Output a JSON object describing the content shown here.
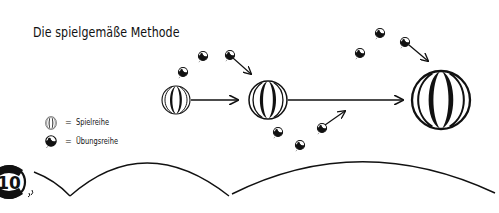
{
  "title": "Die spielgemäße Methode",
  "legend": {
    "items": [
      {
        "icon": "large-striped-ball-icon",
        "equals": "=",
        "label": "Spielreihe"
      },
      {
        "icon": "small-ball-icon",
        "equals": "=",
        "label": "Übungsreihe"
      }
    ]
  },
  "page_badge": {
    "number": "10"
  },
  "colors": {
    "ink": "#111111",
    "background": "#ffffff"
  }
}
